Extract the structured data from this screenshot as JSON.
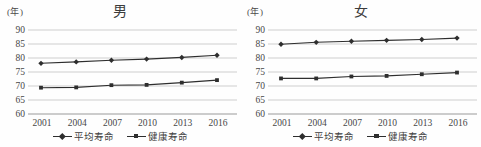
{
  "figure": {
    "unit_label": "(年)",
    "colors": {
      "background": "#fefefe",
      "line": "#2e2e2e",
      "marker": "#2e2e2e",
      "grid": "#c3c3c3",
      "baseline": "#9a9a9a",
      "text": "#474747"
    }
  },
  "chart_data": [
    {
      "type": "line",
      "title": "男",
      "unit": "(年)",
      "categories": [
        "2001",
        "2004",
        "2007",
        "2010",
        "2013",
        "2016"
      ],
      "series": [
        {
          "name": "平均寿命",
          "marker": "diamond",
          "values": [
            78.1,
            78.6,
            79.2,
            79.6,
            80.2,
            81.0
          ]
        },
        {
          "name": "健康寿命",
          "marker": "square",
          "values": [
            69.4,
            69.5,
            70.3,
            70.4,
            71.2,
            72.1
          ]
        }
      ],
      "ylim": [
        60,
        90
      ],
      "ytick_step": 5,
      "grid": true,
      "legend_position": "bottom"
    },
    {
      "type": "line",
      "title": "女",
      "unit": "(年)",
      "categories": [
        "2001",
        "2004",
        "2007",
        "2010",
        "2013",
        "2016"
      ],
      "series": [
        {
          "name": "平均寿命",
          "marker": "diamond",
          "values": [
            84.9,
            85.6,
            86.0,
            86.3,
            86.6,
            87.1
          ]
        },
        {
          "name": "健康寿命",
          "marker": "square",
          "values": [
            72.7,
            72.7,
            73.4,
            73.6,
            74.2,
            74.8
          ]
        }
      ],
      "ylim": [
        60,
        90
      ],
      "ytick_step": 5,
      "grid": true,
      "legend_position": "bottom"
    }
  ]
}
